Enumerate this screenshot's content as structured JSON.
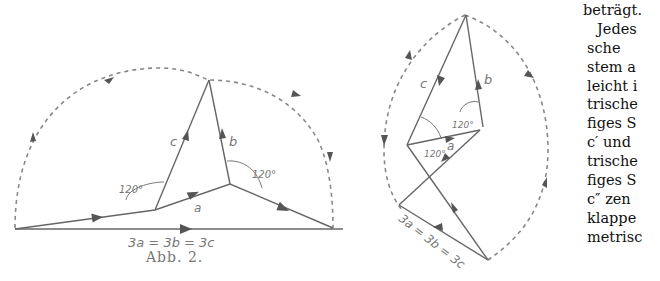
{
  "figure": {
    "caption": "Abb. 2.",
    "left_diagram": {
      "labels": {
        "a": "a",
        "b": "b",
        "c": "c"
      },
      "angle_left": "120°",
      "angle_right": "120°",
      "sum_label": "3a = 3b = 3c"
    },
    "right_diagram": {
      "labels": {
        "a": "a",
        "b": "b",
        "c": "c"
      },
      "angle_left": "120°",
      "angle_top": "120°",
      "sum_label": "3a = 3b = 3c"
    }
  },
  "text_column": {
    "lines": [
      "beträgt.",
      "Jedes",
      "sche",
      "stem a",
      "leicht i",
      "trische",
      "figes S",
      "c′ und",
      "trische",
      "figes S",
      "c″ zen",
      "klappe",
      "metrisc"
    ]
  }
}
